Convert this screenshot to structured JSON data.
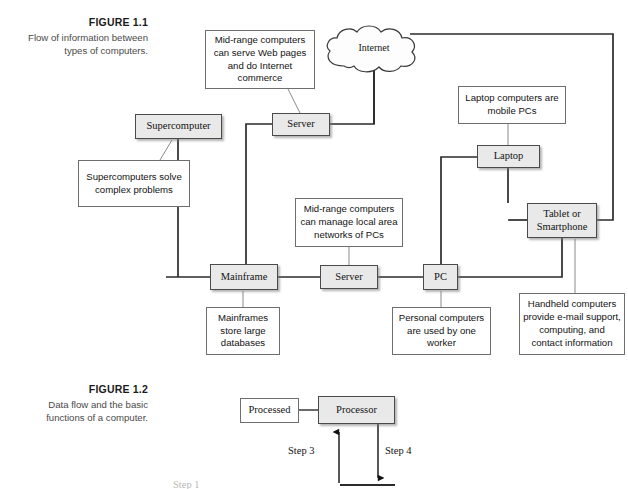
{
  "figures": [
    {
      "id": "figure-1-1",
      "label": "FIGURE 1.1",
      "description": "Flow of information between types of computers."
    },
    {
      "id": "figure-1-2",
      "label": "FIGURE 1.2",
      "description": "Data flow and the basic functions of a computer."
    }
  ],
  "figure1": {
    "caption_label": "FIGURE 1.1",
    "caption_desc": "Flow of information between types of computers.",
    "nodes": {
      "supercomputer": "Supercomputer",
      "server_top": "Server",
      "laptop": "Laptop",
      "tablet": "Tablet or\nSmartphone",
      "tablet_line1": "Tablet or",
      "tablet_line2": "Smartphone",
      "mainframe": "Mainframe",
      "server_mid": "Server",
      "pc": "PC",
      "internet": "Internet"
    },
    "notes": {
      "midrange_web": "Mid-range computers can serve Web pages and do Internet commerce",
      "supercomputers_solve": "Supercomputers solve complex problems",
      "laptop_mobile": "Laptop computers are mobile PCs",
      "midrange_lan": "Mid-range computers can manage local area networks of PCs",
      "mainframes_store": "Mainframes store large databases",
      "personal_one_worker": "Personal computers are used by one worker",
      "handheld_email": "Handheld computers provide e-mail support, computing, and contact information"
    }
  },
  "figure2": {
    "caption_label": "FIGURE 1.2",
    "caption_desc": "Data flow and the basic functions of a computer.",
    "nodes": {
      "processed": "Processed",
      "processor": "Processor"
    },
    "steps": {
      "step3": "Step 3",
      "step4": "Step 4",
      "step1": "Step 1"
    }
  },
  "colors": {
    "node_fill": "#e9e9e9",
    "node_border": "#4a4a4a",
    "note_fill": "#ffffff",
    "note_border": "#6e6e6e",
    "connector": "#2b2b2b",
    "leader": "#8a8a8a",
    "caption_label": "#1b1b1b",
    "caption_desc": "#4a4a4a",
    "page_background": "#ffffff"
  }
}
